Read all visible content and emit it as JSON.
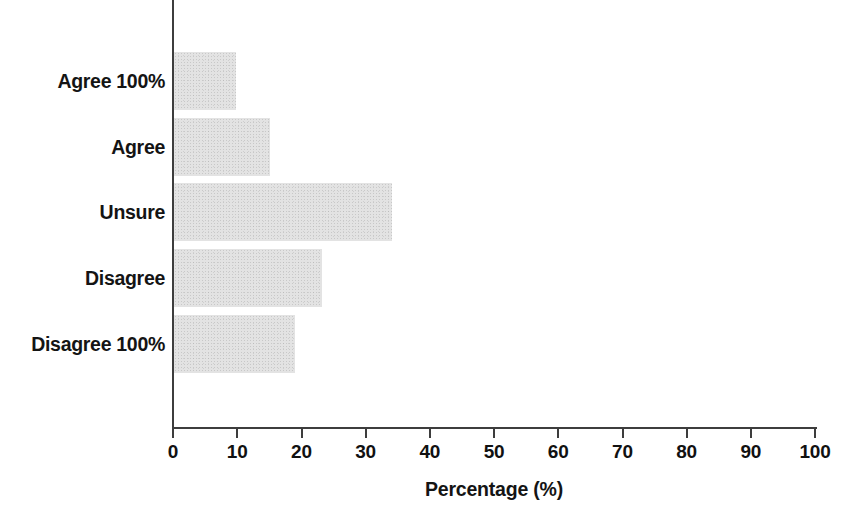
{
  "chart_data": {
    "type": "bar",
    "orientation": "horizontal",
    "title": "",
    "subtitle": "",
    "xlabel": "Percentage (%)",
    "ylabel": "",
    "categories": [
      "Agree 100%",
      "Agree",
      "Unsure",
      "Disagree",
      "Disagree 100%"
    ],
    "values": [
      9.6,
      15.0,
      34.0,
      23.0,
      18.8
    ],
    "series": [
      {
        "name": "Percentage",
        "values": [
          9.6,
          15.0,
          34.0,
          23.0,
          18.8
        ]
      }
    ],
    "xlim": [
      0,
      100
    ],
    "xticks": [
      0,
      10,
      20,
      30,
      40,
      50,
      60,
      70,
      80,
      90,
      100
    ],
    "xtick_labels": [
      "0",
      "10",
      "20",
      "30",
      "40",
      "50",
      "60",
      "70",
      "80",
      "90",
      "100"
    ],
    "grid": false,
    "legend": false,
    "legend_position": "none",
    "bar_color": "#e3e3e3",
    "axis_color": "#3d3d3d",
    "text_color": "#141414",
    "background_color": "#ffffff"
  }
}
